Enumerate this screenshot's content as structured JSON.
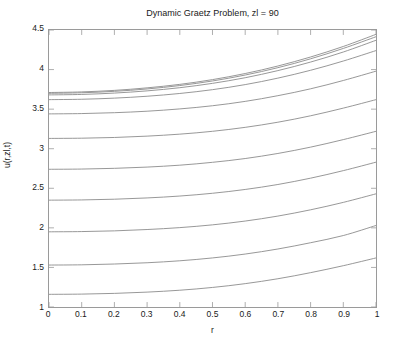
{
  "figure": {
    "background_color": "#ffffff",
    "axis_color": "#9a9a9a",
    "line_color": "#8c8c8c",
    "text_color": "#1a1a1a"
  },
  "chart_data": {
    "type": "line",
    "title": "Dynamic Graetz Problem, zl = 90",
    "xlabel": "r",
    "ylabel": "u(r,zl,t)",
    "xlim": [
      0,
      1
    ],
    "ylim": [
      1,
      4.5
    ],
    "grid": false,
    "legend": null,
    "xticks": [
      0,
      0.1,
      0.2,
      0.3,
      0.4,
      0.5,
      0.6,
      0.7,
      0.8,
      0.9,
      1
    ],
    "xticklabels": [
      "0",
      "0.1",
      "0.2",
      "0.3",
      "0.4",
      "0.5",
      "0.6",
      "0.7",
      "0.8",
      "0.9",
      "1"
    ],
    "yticks": [
      1,
      1.5,
      2,
      2.5,
      3,
      3.5,
      4,
      4.5
    ],
    "yticklabels": [
      "1",
      "1.5",
      "2",
      "2.5",
      "3",
      "3.5",
      "4",
      "4.5"
    ],
    "x": [
      0,
      0.1,
      0.2,
      0.3,
      0.4,
      0.5,
      0.6,
      0.7,
      0.8,
      0.9,
      1
    ],
    "series": [
      {
        "name": "t1",
        "values": [
          1.16,
          1.163,
          1.172,
          1.188,
          1.212,
          1.247,
          1.295,
          1.357,
          1.434,
          1.522,
          1.62
        ]
      },
      {
        "name": "t2",
        "values": [
          1.53,
          1.533,
          1.543,
          1.559,
          1.584,
          1.62,
          1.669,
          1.733,
          1.812,
          1.903,
          2.03
        ]
      },
      {
        "name": "t3",
        "values": [
          1.95,
          1.953,
          1.962,
          1.979,
          2.003,
          2.038,
          2.086,
          2.149,
          2.228,
          2.322,
          2.43
        ]
      },
      {
        "name": "t4",
        "values": [
          2.35,
          2.353,
          2.362,
          2.378,
          2.402,
          2.437,
          2.485,
          2.548,
          2.628,
          2.723,
          2.83
        ]
      },
      {
        "name": "t5",
        "values": [
          2.74,
          2.743,
          2.752,
          2.768,
          2.792,
          2.828,
          2.876,
          2.94,
          3.02,
          3.115,
          3.22
        ]
      },
      {
        "name": "t6",
        "values": [
          3.13,
          3.133,
          3.142,
          3.159,
          3.184,
          3.22,
          3.27,
          3.335,
          3.416,
          3.513,
          3.62
        ]
      },
      {
        "name": "t7",
        "values": [
          3.44,
          3.444,
          3.455,
          3.474,
          3.503,
          3.543,
          3.598,
          3.67,
          3.757,
          3.862,
          3.98
        ]
      },
      {
        "name": "t8",
        "values": [
          3.62,
          3.625,
          3.639,
          3.663,
          3.698,
          3.746,
          3.81,
          3.892,
          3.991,
          4.108,
          4.24
        ]
      },
      {
        "name": "t9",
        "values": [
          3.68,
          3.686,
          3.703,
          3.731,
          3.771,
          3.826,
          3.897,
          3.987,
          4.095,
          4.222,
          4.37
        ]
      },
      {
        "name": "t10",
        "values": [
          3.7,
          3.707,
          3.725,
          3.755,
          3.798,
          3.856,
          3.931,
          4.024,
          4.136,
          4.267,
          4.415
        ]
      },
      {
        "name": "t11",
        "values": [
          3.71,
          3.718,
          3.737,
          3.769,
          3.813,
          3.873,
          3.95,
          4.045,
          4.159,
          4.292,
          4.445
        ]
      }
    ]
  }
}
